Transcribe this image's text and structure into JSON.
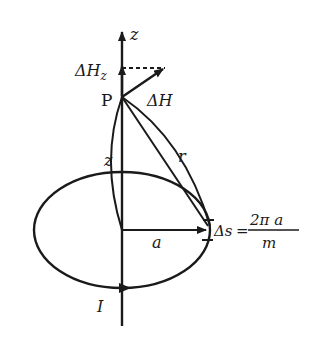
{
  "diagram": {
    "labels": {
      "z_axis": "z",
      "delta_hz": "ΔH",
      "delta_hz_sub": "z",
      "point": "P",
      "delta_h": "ΔH",
      "distance_r": "r",
      "height_z": "z",
      "radius": "a",
      "current": "I",
      "delta_s_lhs": "Δs",
      "equals": "=",
      "fraction_num": "2π a",
      "fraction_den": "m"
    },
    "colors": {
      "stroke": "#1a1a1a",
      "background": "#ffffff"
    }
  }
}
